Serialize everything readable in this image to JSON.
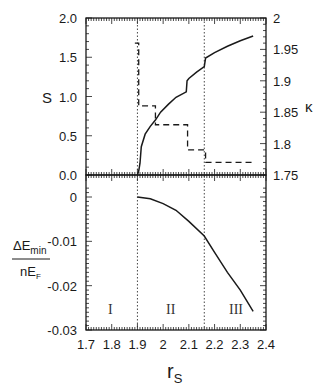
{
  "chart_data": [
    {
      "panel": "upper",
      "type": "line",
      "xlabel": "r_S",
      "ylabel_left": "S",
      "ylabel_right": "κ",
      "xlim": [
        1.7,
        2.4
      ],
      "ylim_left": [
        0.0,
        2.0
      ],
      "ylim_right": [
        1.75,
        2.0
      ],
      "x_ticks": [
        "1.7",
        "1.8",
        "1.9",
        "2",
        "2.1",
        "2.2",
        "2.3",
        "2.4"
      ],
      "y_ticks_left": [
        "0.0",
        "0.5",
        "1.0",
        "1.5",
        "2.0"
      ],
      "y_ticks_right": [
        "1.75",
        "1.8",
        "1.85",
        "1.9",
        "1.95",
        "2"
      ],
      "vlines": [
        1.9,
        2.16
      ],
      "series": [
        {
          "name": "S",
          "axis": "left",
          "style": "solid",
          "x": [
            1.9,
            1.905,
            1.91,
            1.915,
            1.93,
            1.95,
            1.97,
            1.99,
            2.02,
            2.05,
            2.09,
            2.093,
            2.1,
            2.13,
            2.16,
            2.165,
            2.2,
            2.25,
            2.3,
            2.35
          ],
          "y": [
            0.0,
            0.05,
            0.15,
            0.36,
            0.52,
            0.62,
            0.7,
            0.8,
            0.9,
            0.99,
            1.06,
            1.2,
            1.23,
            1.31,
            1.38,
            1.49,
            1.56,
            1.64,
            1.71,
            1.77
          ]
        },
        {
          "name": "κ",
          "axis": "right",
          "style": "dashed",
          "x": [
            1.89,
            1.905,
            1.905,
            1.97,
            1.97,
            2.095,
            2.095,
            2.165,
            2.165,
            2.35
          ],
          "y": [
            1.96,
            1.96,
            1.86,
            1.86,
            1.83,
            1.83,
            1.79,
            1.79,
            1.77,
            1.77
          ]
        }
      ]
    },
    {
      "panel": "lower",
      "type": "line",
      "xlabel": "r_S",
      "ylabel": "ΔE_min / nE_F",
      "xlim": [
        1.7,
        2.4
      ],
      "ylim": [
        -0.03,
        0.003
      ],
      "x_ticks": [
        "1.7",
        "1.8",
        "1.9",
        "2",
        "2.1",
        "2.2",
        "2.3",
        "2.4"
      ],
      "y_ticks": [
        "0",
        "-0.01",
        "-0.02",
        "-0.03"
      ],
      "vlines": [
        1.9,
        2.16
      ],
      "annotations": [
        {
          "text": "I",
          "x": 1.8
        },
        {
          "text": "II",
          "x": 2.03
        },
        {
          "text": "III",
          "x": 2.28
        }
      ],
      "series": [
        {
          "name": "ΔE_min/nE_F",
          "style": "solid",
          "x": [
            1.9,
            1.95,
            2.0,
            2.05,
            2.1,
            2.16,
            2.2,
            2.25,
            2.3,
            2.35
          ],
          "y": [
            0.0,
            -0.0004,
            -0.0015,
            -0.003,
            -0.0055,
            -0.0088,
            -0.0125,
            -0.017,
            -0.021,
            -0.0258
          ]
        }
      ]
    }
  ],
  "labels": {
    "left_upper": "S",
    "right_upper": "κ",
    "x_axis_main": "r",
    "x_axis_sub": "S",
    "lower_num_main": "ΔE",
    "lower_num_sub": "min",
    "lower_den_main": "nE",
    "lower_den_sub": "F",
    "region_1": "I",
    "region_2": "II",
    "region_3": "III"
  }
}
